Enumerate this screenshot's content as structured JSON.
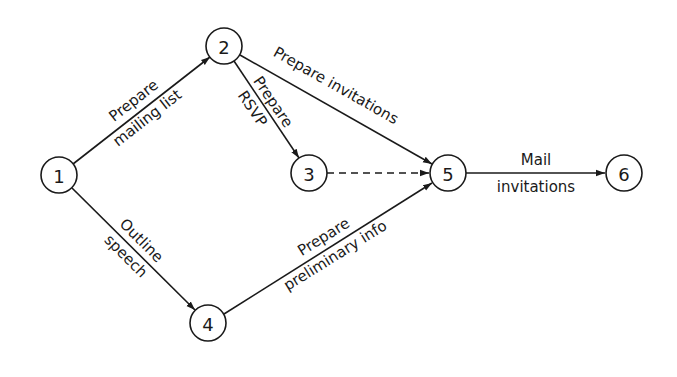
{
  "diagram": {
    "type": "activity-network (PERT)",
    "nodes": [
      {
        "id": "1",
        "label": "1"
      },
      {
        "id": "2",
        "label": "2"
      },
      {
        "id": "3",
        "label": "3"
      },
      {
        "id": "4",
        "label": "4"
      },
      {
        "id": "5",
        "label": "5"
      },
      {
        "id": "6",
        "label": "6"
      }
    ],
    "edges": [
      {
        "from": "1",
        "to": "2",
        "style": "solid",
        "label_above": "Prepare",
        "label_below": "mailing list"
      },
      {
        "from": "2",
        "to": "3",
        "style": "solid",
        "label_above": "Prepare",
        "label_below": "RSVP"
      },
      {
        "from": "2",
        "to": "5",
        "style": "solid",
        "label_above": "Prepare invitations",
        "label_below": ""
      },
      {
        "from": "3",
        "to": "5",
        "style": "dashed",
        "label_above": "",
        "label_below": ""
      },
      {
        "from": "1",
        "to": "4",
        "style": "solid",
        "label_above": "Outline",
        "label_below": "speech"
      },
      {
        "from": "4",
        "to": "5",
        "style": "solid",
        "label_above": "Prepare",
        "label_below": "preliminary info"
      },
      {
        "from": "5",
        "to": "6",
        "style": "solid",
        "label_above": "Mail",
        "label_below": "invitations"
      }
    ]
  }
}
